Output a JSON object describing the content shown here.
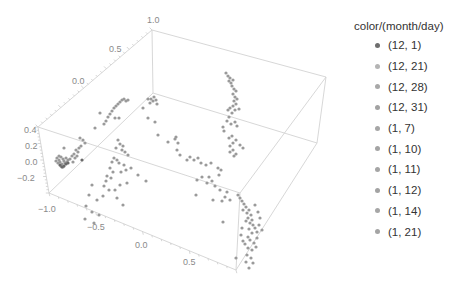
{
  "chart_data": {
    "type": "scatter",
    "subtype": "3d-scatter",
    "title": "",
    "xlabel": "",
    "ylabel": "",
    "zlabel": "",
    "axes": {
      "x": {
        "ticks": [
          -1.0,
          -0.5,
          0.0,
          0.5
        ],
        "tick_labels": [
          "−1.0",
          "−0.5",
          "0.0",
          "0.5"
        ],
        "range": [
          -1.2,
          0.8
        ]
      },
      "y": {
        "ticks": [
          0.0,
          0.5,
          1.0
        ],
        "tick_labels": [
          "0.0",
          "0.5",
          "1.0"
        ],
        "range": [
          -0.6,
          1.0
        ]
      },
      "z": {
        "ticks": [
          -0.2,
          0.0,
          0.2,
          0.4
        ],
        "tick_labels": [
          "−0.2",
          "0.0",
          "0.2",
          "0.4"
        ],
        "range": [
          -0.35,
          0.42
        ]
      }
    },
    "grid": false,
    "box": true,
    "legend_position": "right",
    "legend_title": "color/(month/day)",
    "series": [
      {
        "name": "(12, 1)",
        "color": "#6e6e6e"
      },
      {
        "name": "(12, 21)",
        "color": "#b4b4b4"
      },
      {
        "name": "(12, 28)",
        "color": "#a8a8a8"
      },
      {
        "name": "(12, 31)",
        "color": "#a2a2a2"
      },
      {
        "name": "(1, 7)",
        "color": "#a6a6a6"
      },
      {
        "name": "(1, 10)",
        "color": "#a4a4a4"
      },
      {
        "name": "(1, 11)",
        "color": "#a5a5a5"
      },
      {
        "name": "(1, 12)",
        "color": "#a3a3a3"
      },
      {
        "name": "(1, 14)",
        "color": "#a6a6a6"
      },
      {
        "name": "(1, 21)",
        "color": "#a4a4a4"
      }
    ],
    "points_screen": [
      [
        57,
        158
      ],
      [
        59,
        160
      ],
      [
        61,
        157
      ],
      [
        63,
        159
      ],
      [
        60,
        162
      ],
      [
        58,
        163
      ],
      [
        62,
        164
      ],
      [
        64,
        161
      ],
      [
        66,
        158
      ],
      [
        65,
        163
      ],
      [
        61,
        166
      ],
      [
        63,
        167
      ],
      [
        67,
        162
      ],
      [
        59,
        156
      ],
      [
        56,
        161
      ],
      [
        68,
        160
      ],
      [
        70,
        159
      ],
      [
        72,
        156
      ],
      [
        74,
        154
      ],
      [
        76,
        150
      ],
      [
        78,
        152
      ],
      [
        79,
        148
      ],
      [
        81,
        146
      ],
      [
        77,
        156
      ],
      [
        75,
        158
      ],
      [
        73,
        162
      ],
      [
        83,
        140
      ],
      [
        85,
        143
      ],
      [
        80,
        138
      ],
      [
        64,
        148
      ],
      [
        92,
        185
      ],
      [
        108,
        117
      ],
      [
        110,
        114
      ],
      [
        112,
        111
      ],
      [
        114,
        108
      ],
      [
        116,
        106
      ],
      [
        118,
        104
      ],
      [
        120,
        102
      ],
      [
        122,
        100
      ],
      [
        124,
        99
      ],
      [
        126,
        101
      ],
      [
        128,
        100
      ],
      [
        106,
        121
      ],
      [
        104,
        124
      ],
      [
        115,
        118
      ],
      [
        119,
        118
      ],
      [
        95,
        128
      ],
      [
        100,
        113
      ],
      [
        151,
        99
      ],
      [
        153,
        101
      ],
      [
        154,
        97
      ],
      [
        156,
        100
      ],
      [
        150,
        103
      ],
      [
        148,
        99
      ],
      [
        157,
        104
      ],
      [
        143,
        108
      ],
      [
        148,
        118
      ],
      [
        155,
        122
      ],
      [
        158,
        135
      ],
      [
        168,
        142
      ],
      [
        118,
        140
      ],
      [
        120,
        144
      ],
      [
        123,
        146
      ],
      [
        116,
        148
      ],
      [
        122,
        150
      ],
      [
        125,
        152
      ],
      [
        128,
        155
      ],
      [
        114,
        158
      ],
      [
        117,
        160
      ],
      [
        112,
        162
      ],
      [
        119,
        163
      ],
      [
        124,
        165
      ],
      [
        110,
        168
      ],
      [
        113,
        172
      ],
      [
        121,
        172
      ],
      [
        126,
        170
      ],
      [
        107,
        176
      ],
      [
        111,
        178
      ],
      [
        106,
        181
      ],
      [
        104,
        186
      ],
      [
        109,
        190
      ],
      [
        115,
        190
      ],
      [
        120,
        185
      ],
      [
        127,
        183
      ],
      [
        103,
        196
      ],
      [
        117,
        198
      ],
      [
        131,
        168
      ],
      [
        138,
        175
      ],
      [
        146,
        181
      ],
      [
        123,
        205
      ],
      [
        176,
        137
      ],
      [
        175,
        139
      ],
      [
        178,
        143
      ],
      [
        177,
        150
      ],
      [
        180,
        155
      ],
      [
        196,
        195
      ],
      [
        226,
        73
      ],
      [
        228,
        76
      ],
      [
        230,
        78
      ],
      [
        229,
        81
      ],
      [
        231,
        83
      ],
      [
        233,
        80
      ],
      [
        232,
        86
      ],
      [
        234,
        89
      ],
      [
        236,
        91
      ],
      [
        233,
        94
      ],
      [
        235,
        97
      ],
      [
        237,
        99
      ],
      [
        234,
        101
      ],
      [
        236,
        104
      ],
      [
        233,
        106
      ],
      [
        230,
        108
      ],
      [
        228,
        110
      ],
      [
        235,
        110
      ],
      [
        239,
        109
      ],
      [
        232,
        113
      ],
      [
        229,
        117
      ],
      [
        227,
        121
      ],
      [
        231,
        124
      ],
      [
        235,
        122
      ],
      [
        237,
        126
      ],
      [
        224,
        131
      ],
      [
        223,
        127
      ],
      [
        229,
        138
      ],
      [
        232,
        136
      ],
      [
        236,
        140
      ],
      [
        233,
        143
      ],
      [
        230,
        146
      ],
      [
        233,
        150
      ],
      [
        230,
        152
      ],
      [
        236,
        154
      ],
      [
        234,
        156
      ],
      [
        240,
        145
      ],
      [
        243,
        148
      ],
      [
        190,
        157
      ],
      [
        187,
        160
      ],
      [
        194,
        160
      ],
      [
        198,
        158
      ],
      [
        201,
        163
      ],
      [
        206,
        165
      ],
      [
        211,
        163
      ],
      [
        218,
        168
      ],
      [
        221,
        170
      ],
      [
        219,
        175
      ],
      [
        209,
        177
      ],
      [
        212,
        181
      ],
      [
        202,
        177
      ],
      [
        197,
        180
      ],
      [
        207,
        183
      ],
      [
        215,
        186
      ],
      [
        220,
        190
      ],
      [
        227,
        192
      ],
      [
        225,
        197
      ],
      [
        222,
        201
      ],
      [
        230,
        200
      ],
      [
        213,
        200
      ],
      [
        238,
        195
      ],
      [
        240,
        198
      ],
      [
        242,
        201
      ],
      [
        244,
        204
      ],
      [
        246,
        207
      ],
      [
        243,
        210
      ],
      [
        247,
        213
      ],
      [
        249,
        210
      ],
      [
        251,
        215
      ],
      [
        248,
        218
      ],
      [
        252,
        220
      ],
      [
        250,
        223
      ],
      [
        246,
        221
      ],
      [
        253,
        225
      ],
      [
        249,
        229
      ],
      [
        255,
        228
      ],
      [
        257,
        232
      ],
      [
        252,
        233
      ],
      [
        248,
        237
      ],
      [
        250,
        240
      ],
      [
        254,
        243
      ],
      [
        256,
        247
      ],
      [
        252,
        250
      ],
      [
        248,
        248
      ],
      [
        245,
        244
      ],
      [
        243,
        241
      ],
      [
        247,
        255
      ],
      [
        251,
        258
      ],
      [
        246,
        262
      ],
      [
        253,
        263
      ],
      [
        242,
        228
      ],
      [
        241,
        235
      ],
      [
        255,
        205
      ],
      [
        258,
        212
      ],
      [
        260,
        218
      ],
      [
        259,
        225
      ],
      [
        262,
        230
      ],
      [
        257,
        238
      ],
      [
        223,
        222
      ],
      [
        236,
        258
      ],
      [
        249,
        268
      ],
      [
        86,
        206
      ],
      [
        97,
        200
      ],
      [
        89,
        195
      ],
      [
        92,
        212
      ],
      [
        99,
        215
      ],
      [
        94,
        223
      ],
      [
        85,
        219
      ]
    ],
    "highlight_points_screen": [
      [
        60,
        165
      ],
      [
        62,
        167
      ],
      [
        64,
        166
      ],
      [
        66,
        164
      ],
      [
        68,
        163
      ],
      [
        82,
        160
      ]
    ]
  },
  "legend": {
    "title": "color/(month/day)",
    "items": [
      {
        "label": "(12, 1)",
        "color": "#6e6e6e"
      },
      {
        "label": "(12, 21)",
        "color": "#b4b4b4"
      },
      {
        "label": "(12, 28)",
        "color": "#a8a8a8"
      },
      {
        "label": "(12, 31)",
        "color": "#a2a2a2"
      },
      {
        "label": "(1, 7)",
        "color": "#a6a6a6"
      },
      {
        "label": "(1, 10)",
        "color": "#a4a4a4"
      },
      {
        "label": "(1, 11)",
        "color": "#a5a5a5"
      },
      {
        "label": "(1, 12)",
        "color": "#a3a3a3"
      },
      {
        "label": "(1, 14)",
        "color": "#a6a6a6"
      },
      {
        "label": "(1, 21)",
        "color": "#a4a4a4"
      }
    ]
  },
  "tick_labels": {
    "top_axis": [
      {
        "text": "1.0",
        "x": 147,
        "y": 23
      },
      {
        "text": "0.5",
        "x": 109,
        "y": 52
      },
      {
        "text": "0.0",
        "x": 72,
        "y": 84
      }
    ],
    "vertical_axis": [
      {
        "text": "0.4",
        "x": 24,
        "y": 133
      },
      {
        "text": "0.2",
        "x": 25,
        "y": 149
      },
      {
        "text": "0.0",
        "x": 25,
        "y": 165
      },
      {
        "text": "−0.2",
        "x": 17,
        "y": 181
      }
    ],
    "bottom_axis": [
      {
        "text": "−1.0",
        "x": 38,
        "y": 212
      },
      {
        "text": "−0.5",
        "x": 87,
        "y": 230
      },
      {
        "text": "0.0",
        "x": 135,
        "y": 248
      },
      {
        "text": "0.5",
        "x": 183,
        "y": 265
      }
    ]
  },
  "colors": {
    "box_line": "#d2d2d2",
    "point": "#9a9a9a",
    "point_dark": "#6a6a6a",
    "tick_text": "#8a8a8a"
  }
}
